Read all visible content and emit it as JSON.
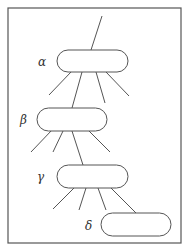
{
  "diagram": {
    "stroke_color": "#555555",
    "background": "#ffffff",
    "frame": {
      "x": 8,
      "y": 8,
      "w": 173,
      "h": 235
    },
    "nodes": [
      {
        "id": "alpha",
        "label": "α",
        "x": 57,
        "y": 50,
        "w": 71,
        "h": 22,
        "label_x": 38,
        "label_y": 66
      },
      {
        "id": "beta",
        "label": "β",
        "x": 37,
        "y": 108,
        "w": 70,
        "h": 23,
        "label_x": 20,
        "label_y": 124
      },
      {
        "id": "gamma",
        "label": "γ",
        "x": 57,
        "y": 165,
        "w": 71,
        "h": 23,
        "label_x": 37,
        "label_y": 181
      },
      {
        "id": "delta",
        "label": "δ",
        "x": 101,
        "y": 213,
        "w": 70,
        "h": 23,
        "label_x": 85,
        "label_y": 230
      }
    ],
    "edges": [
      {
        "from": "root",
        "x1": 102,
        "y1": 16,
        "x2": 91,
        "y2": 50
      },
      {
        "from": "alpha",
        "x1": 71,
        "y1": 72,
        "x2": 49,
        "y2": 95
      },
      {
        "from": "alpha",
        "x1": 82,
        "y1": 72,
        "x2": 72,
        "y2": 108
      },
      {
        "from": "alpha",
        "x1": 96,
        "y1": 72,
        "x2": 105,
        "y2": 103
      },
      {
        "from": "alpha",
        "x1": 106,
        "y1": 72,
        "x2": 129,
        "y2": 96
      },
      {
        "from": "beta",
        "x1": 52,
        "y1": 130,
        "x2": 31,
        "y2": 152
      },
      {
        "from": "beta",
        "x1": 63,
        "y1": 131,
        "x2": 53,
        "y2": 152
      },
      {
        "from": "beta",
        "x1": 72,
        "y1": 131,
        "x2": 83,
        "y2": 165
      },
      {
        "from": "beta",
        "x1": 88,
        "y1": 130,
        "x2": 110,
        "y2": 152
      },
      {
        "from": "gamma",
        "x1": 75,
        "y1": 187,
        "x2": 53,
        "y2": 209
      },
      {
        "from": "gamma",
        "x1": 86,
        "y1": 188,
        "x2": 79,
        "y2": 210
      },
      {
        "from": "gamma",
        "x1": 98,
        "y1": 188,
        "x2": 106,
        "y2": 210
      },
      {
        "from": "gamma",
        "x1": 110,
        "y1": 187,
        "x2": 136,
        "y2": 213
      }
    ]
  }
}
